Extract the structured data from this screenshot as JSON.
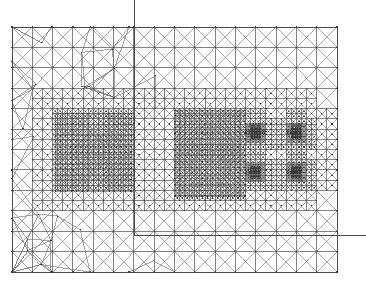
{
  "figure": {
    "width": 366,
    "height": 285,
    "background_color": "#ffffff",
    "line_color": "#6b6b6b",
    "line_color_dark": "#4a4a4a",
    "line_width": 0.6
  },
  "chart_data": {
    "type": "diagram",
    "title": "",
    "xlabel": "",
    "ylabel": "",
    "domain": {
      "x0": 12,
      "y0": 27,
      "x1": 337,
      "y1": 272,
      "description": "Rectangular mesh domain boundary"
    },
    "axis_lines": [
      {
        "name": "vertical-symmetry-line",
        "x1": 134,
        "y1": 0,
        "x2": 134,
        "y2": 235
      },
      {
        "name": "horizontal-symmetry-line",
        "x1": 134,
        "y1": 235,
        "x2": 366,
        "y2": 235
      }
    ],
    "refinement_regions": [
      {
        "name": "left-fine-block",
        "x0": 55,
        "y0": 113,
        "x1": 131,
        "y1": 191,
        "cell": 5.6,
        "pattern": "criss-cross-quad"
      },
      {
        "name": "center-fine-block",
        "x0": 175,
        "y0": 110,
        "x1": 245,
        "y1": 196,
        "cell": 5.6,
        "pattern": "criss-cross-quad"
      }
    ],
    "point_clusters": [
      {
        "name": "cluster-upper-left",
        "cx": 256,
        "cy": 133,
        "r": 8
      },
      {
        "name": "cluster-upper-right",
        "cx": 296,
        "cy": 133,
        "r": 8
      },
      {
        "name": "cluster-lower-left",
        "cx": 255,
        "cy": 172,
        "r": 8
      },
      {
        "name": "cluster-lower-right",
        "cx": 296,
        "cy": 172,
        "r": 8
      }
    ],
    "grid_levels": {
      "base_cell": 44.8,
      "levels": [
        1,
        2,
        3,
        4,
        5,
        6
      ],
      "note": "Quadtree refinement toward two fine blocks and four point clusters"
    },
    "legend": {
      "entries": [],
      "position": "none"
    },
    "annotations": []
  }
}
